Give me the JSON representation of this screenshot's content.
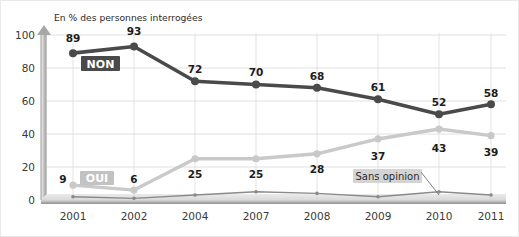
{
  "chart_data": {
    "type": "line",
    "title": "",
    "subtitle": "",
    "axis_note": "En % des personnes interrogées",
    "xlabel": "",
    "ylabel": "",
    "ylim": [
      0,
      100
    ],
    "yticks": [
      "0",
      "20",
      "40",
      "60",
      "80",
      "100"
    ],
    "grid": true,
    "legend_position": "inline-annotations",
    "categories": [
      "2001",
      "2002",
      "2004",
      "2007",
      "2008",
      "2009",
      "2010",
      "2011"
    ],
    "series": [
      {
        "name": "NON",
        "color": "#4a4a4a",
        "values": [
          89,
          93,
          72,
          70,
          68,
          61,
          52,
          58
        ],
        "labels": [
          "89",
          "93",
          "72",
          "70",
          "68",
          "61",
          "52",
          "58"
        ]
      },
      {
        "name": "OUI",
        "color": "#c9c9c9",
        "values": [
          9,
          6,
          25,
          25,
          28,
          37,
          43,
          39
        ],
        "labels": [
          "9",
          "6",
          "25",
          "25",
          "28",
          "37",
          "43",
          "39"
        ]
      },
      {
        "name": "Sans opinion",
        "color": "#8a8a8a",
        "values": [
          2,
          1,
          3,
          5,
          4,
          2,
          5,
          3
        ],
        "labels": [
          "",
          "",
          "",
          "",
          "",
          "",
          "",
          ""
        ]
      }
    ],
    "annotations": [
      {
        "name": "NON",
        "text": "NON",
        "style": "dark-badge"
      },
      {
        "name": "OUI",
        "text": "OUI",
        "style": "light-badge"
      },
      {
        "name": "Sans opinion",
        "text": "Sans opinion",
        "style": "pale-badge-with-leader"
      }
    ]
  },
  "colors": {
    "non_line": "#4a4a4a",
    "oui_line": "#c9c9c9",
    "sans_line": "#8a8a8a",
    "non_badge_bg": "#4a4a4a",
    "oui_badge_bg": "#c2c2c2",
    "sans_badge_bg": "#d4d4d4",
    "axis": "#9a9a9a",
    "grid": "#d8d8d8",
    "background": "#ffffff"
  }
}
